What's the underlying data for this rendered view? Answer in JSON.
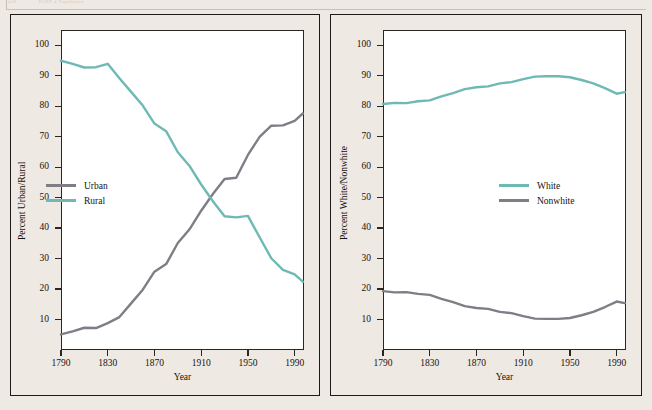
{
  "page": {
    "running_head_number": "418",
    "running_head_title": "PART 4  Population",
    "background_color": "#efe9e3"
  },
  "colors": {
    "teal": "#6fb9b4",
    "gray": "#7f7d85",
    "axis": "#2a2622",
    "panel_border": "#1d1a17",
    "plot_background": "#ffffff"
  },
  "chart_data": [
    {
      "type": "line",
      "title": "",
      "xlabel": "Year",
      "ylabel": "Percent Urban/Rural",
      "xlim": [
        1790,
        1998
      ],
      "ylim": [
        0,
        105
      ],
      "xticks": [
        1790,
        1830,
        1870,
        1910,
        1950,
        1990
      ],
      "xticklabels": [
        "1790",
        "1830",
        "1870",
        "1910",
        "1950",
        "1990"
      ],
      "yticks": [
        10,
        20,
        30,
        40,
        50,
        60,
        70,
        80,
        90,
        100
      ],
      "yticklabels": [
        "10",
        "20",
        "30",
        "40",
        "50",
        "60",
        "70",
        "80",
        "90",
        "100"
      ],
      "grid": false,
      "legend_position": "center-left",
      "x": [
        1790,
        1800,
        1810,
        1820,
        1830,
        1840,
        1850,
        1860,
        1870,
        1880,
        1890,
        1900,
        1910,
        1920,
        1930,
        1940,
        1950,
        1960,
        1970,
        1980,
        1990,
        1997
      ],
      "series": [
        {
          "name": "Urban",
          "color": "#7f7d85",
          "values": [
            5.1,
            6.1,
            7.3,
            7.2,
            8.8,
            10.8,
            15.3,
            19.8,
            25.7,
            28.2,
            35.1,
            39.6,
            45.7,
            51.2,
            56.1,
            56.5,
            64.0,
            69.9,
            73.6,
            73.7,
            75.2,
            77.6
          ]
        },
        {
          "name": "Rural",
          "color": "#6fb9b4",
          "values": [
            94.9,
            93.9,
            92.7,
            92.8,
            93.9,
            89.2,
            84.7,
            80.2,
            74.3,
            71.8,
            64.9,
            60.4,
            54.3,
            48.8,
            43.9,
            43.5,
            44.0,
            37.0,
            30.1,
            26.3,
            24.8,
            22.4
          ]
        }
      ]
    },
    {
      "type": "line",
      "title": "",
      "xlabel": "Year",
      "ylabel": "Percent White/Nonwhite",
      "xlim": [
        1790,
        1998
      ],
      "ylim": [
        0,
        105
      ],
      "xticks": [
        1790,
        1830,
        1870,
        1910,
        1950,
        1990
      ],
      "xticklabels": [
        "1790",
        "1830",
        "1870",
        "1910",
        "1950",
        "1990"
      ],
      "yticks": [
        10,
        20,
        30,
        40,
        50,
        60,
        70,
        80,
        90,
        100
      ],
      "yticklabels": [
        "10",
        "20",
        "30",
        "40",
        "50",
        "60",
        "70",
        "80",
        "90",
        "100"
      ],
      "grid": false,
      "legend_position": "center-right",
      "x": [
        1790,
        1800,
        1810,
        1820,
        1830,
        1840,
        1850,
        1860,
        1870,
        1880,
        1890,
        1900,
        1910,
        1920,
        1930,
        1940,
        1950,
        1960,
        1970,
        1980,
        1990,
        1997
      ],
      "series": [
        {
          "name": "White",
          "color": "#6fb9b4",
          "values": [
            80.7,
            81.1,
            81.0,
            81.6,
            81.9,
            83.2,
            84.3,
            85.6,
            86.2,
            86.5,
            87.5,
            87.9,
            88.9,
            89.7,
            89.8,
            89.8,
            89.5,
            88.6,
            87.5,
            85.9,
            84.1,
            84.6
          ]
        },
        {
          "name": "Nonwhite",
          "color": "#7f7d85",
          "values": [
            19.3,
            18.9,
            19.0,
            18.4,
            18.1,
            16.8,
            15.7,
            14.4,
            13.8,
            13.5,
            12.5,
            12.1,
            11.1,
            10.3,
            10.2,
            10.2,
            10.5,
            11.4,
            12.5,
            14.1,
            15.9,
            15.4
          ]
        }
      ]
    }
  ]
}
